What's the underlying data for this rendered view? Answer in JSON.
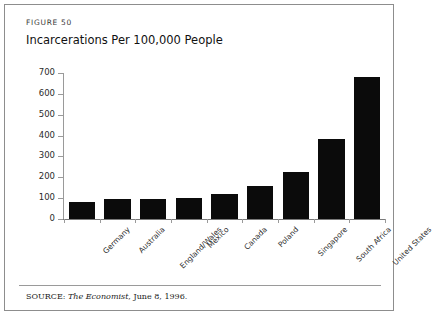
{
  "figure": {
    "number_label": "FIGURE 50",
    "title": "Incarcerations Per 100,000 People",
    "source_prefix": "SOURCE:",
    "source_publication": "The Economist",
    "source_rest": ", June 8, 1996."
  },
  "chart_data": {
    "type": "bar",
    "title": "Incarcerations Per 100,000 People",
    "xlabel": "",
    "ylabel": "",
    "ylim": [
      0,
      700
    ],
    "yticks": [
      0,
      100,
      200,
      300,
      400,
      500,
      600,
      700
    ],
    "ytick_labels": [
      "0",
      "100",
      "200",
      "300",
      "400",
      "500",
      "600",
      "700"
    ],
    "grid": false,
    "legend": false,
    "bar_color": "#0b0b0b",
    "categories": [
      "Germany",
      "Australia",
      "England/Wales",
      "Mexico",
      "Canada",
      "Poland",
      "Singapore",
      "South Africa",
      "United States"
    ],
    "values": [
      80,
      95,
      95,
      100,
      120,
      160,
      225,
      385,
      680
    ]
  }
}
